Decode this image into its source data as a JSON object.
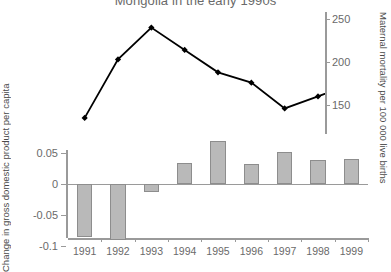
{
  "chart_data": {
    "type": "line",
    "title": "Mongolia in the early 1990s",
    "categories": [
      "1991",
      "1992",
      "1993",
      "1994",
      "1995",
      "1996",
      "1997",
      "1998",
      "1999"
    ],
    "xlabel": "",
    "panels": [
      {
        "type": "line",
        "name": "maternal-mortality",
        "ylabel": "Maternal mortality per\n100 000 live births",
        "ylabel_lines": [
          "Maternal mortality per",
          "100 000 live births"
        ],
        "axis_position": "right",
        "ylim": [
          125,
          255
        ],
        "yticks": [
          150,
          200,
          250
        ],
        "ytick_labels": [
          "150",
          "200",
          "250"
        ],
        "grid": false,
        "marker": "diamond",
        "line_color": "#000000",
        "values": [
          135,
          203,
          240,
          214,
          188,
          176,
          146,
          160,
          175
        ]
      },
      {
        "type": "bar",
        "name": "gdp-change",
        "ylabel": "Change in gross domestic\nproduct per capita",
        "ylabel_lines": [
          "Change in gross domestic",
          "product per capita"
        ],
        "axis_position": "left",
        "ylim": [
          -0.1,
          0.075
        ],
        "yticks": [
          0.05,
          0,
          -0.05,
          -0.1
        ],
        "ytick_labels": [
          "0.05",
          "0",
          "-0.05",
          "-0.1"
        ],
        "grid": false,
        "bar_color": "#b9b9b9",
        "bar_edge_color": "#8d8d8d",
        "values": [
          -0.085,
          -0.091,
          -0.013,
          0.034,
          0.07,
          0.032,
          0.052,
          0.039,
          0.04
        ]
      }
    ]
  }
}
